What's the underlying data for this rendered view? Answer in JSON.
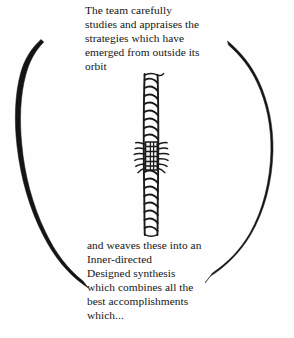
{
  "figure": {
    "background_color": "#fefefe",
    "ink_color": "#141414",
    "caption_top": "The team carefully\nstudies and appraises the\nstrategies which have\nemerged from outside its\norbit",
    "caption_bottom": "and weaves these into an\nInner-directed\nDesigned synthesis\nwhich combines all the\nbest accomplishments\nwhich...",
    "top_lines": [
      "The team carefully",
      "studies and appraises the",
      "strategies which have",
      "emerged from outside its",
      "orbit"
    ],
    "bottom_lines": [
      "and weaves these into an",
      "Inner-directed",
      "Designed synthesis",
      "which combines all the",
      "best accomplishments",
      "which..."
    ],
    "shapes": {
      "ellipse_label": "open-ellipse-outline",
      "left_arc_label": "left-arc",
      "right_arc_label": "right-arc",
      "rope_label": "twisted-rope-cord",
      "knot_label": "rope-knot-binding"
    }
  }
}
